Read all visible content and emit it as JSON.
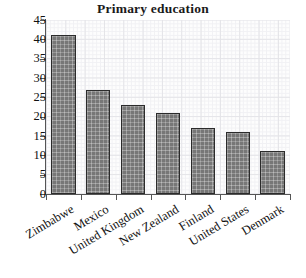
{
  "chart_data": {
    "type": "bar",
    "title": "Primary education",
    "xlabel": "",
    "ylabel": "",
    "categories": [
      "Zimbabwe",
      "Mexico",
      "United Kingdom",
      "New Zealand",
      "Finland",
      "United States",
      "Denmark"
    ],
    "values": [
      41,
      27,
      23,
      21,
      17,
      16,
      11
    ],
    "ylim": [
      0,
      45
    ],
    "ytick_step": 5,
    "yticks": [
      0,
      5,
      10,
      15,
      20,
      25,
      30,
      35,
      40,
      45
    ],
    "ytick_labels": [
      "0",
      "5",
      "10",
      "15",
      "20",
      "25",
      "30",
      "35",
      "40",
      "45"
    ],
    "grid": true,
    "legend": false,
    "bar_color": "#777777",
    "bar_edge_color": "#2b2b2b",
    "bar_pattern": "crosshatch",
    "plot_background": "#fdfdfd",
    "grid_color": "#e4e4e8",
    "axis_color": "#555555",
    "title_color": "#1a1a1a",
    "xtick_label_rotation": -31
  }
}
